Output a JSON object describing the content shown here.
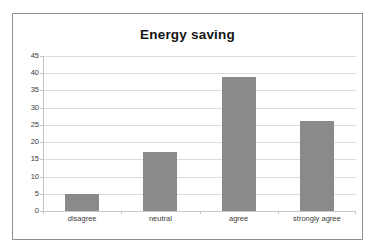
{
  "chart_data": {
    "type": "bar",
    "title": "Energy saving",
    "categories": [
      "disagree",
      "neutral",
      "agree",
      "strongly agree"
    ],
    "values": [
      5,
      17,
      39,
      26
    ],
    "xlabel": "",
    "ylabel": "",
    "ylim": [
      0,
      45
    ],
    "ytick_step": 5,
    "yticks": [
      0,
      5,
      10,
      15,
      20,
      25,
      30,
      35,
      40,
      45
    ],
    "ytick_labels": [
      "0",
      "5",
      "10",
      "15",
      "20",
      "25",
      "30",
      "35",
      "40",
      "45"
    ],
    "grid": true,
    "grid_axis": "y",
    "legend": false,
    "legend_position": "none",
    "bar_color": "#8a8a8a",
    "gridline_color": "#dcdcdc",
    "axis_color": "#c4c4c4",
    "frame_color": "#8f8f8f",
    "background_color": "#ffffff",
    "title_color": "#141414",
    "tick_label_color": "#3b3b3b"
  }
}
